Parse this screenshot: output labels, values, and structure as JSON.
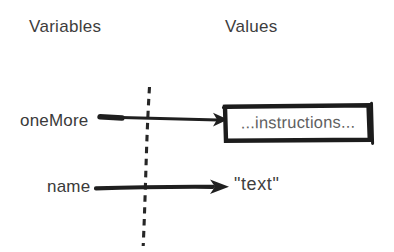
{
  "headers": {
    "variables": "Variables",
    "values": "Values"
  },
  "bindings": [
    {
      "variable": "oneMore",
      "value": "...instructions...",
      "representation": "boxed-reference"
    },
    {
      "variable": "name",
      "value": "\"text\"",
      "representation": "plain-literal"
    }
  ],
  "colors": {
    "background": "#ffffff",
    "stroke": "#1f1f1f",
    "box_border": "#1c1c1c",
    "header_text": "#3d3d3d",
    "label_text": "#3a3a3a",
    "boxed_value_text": "#5f5f5f",
    "literal_text": "#3f3f3f"
  }
}
